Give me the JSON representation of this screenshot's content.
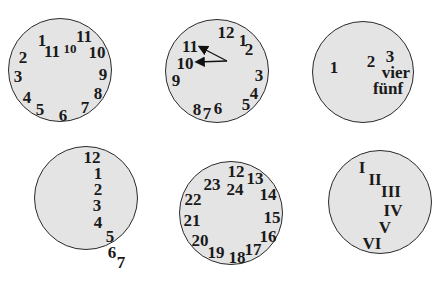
{
  "figure": {
    "colors": {
      "face": "#e4e4e4",
      "outline": "#2a2a2a",
      "text": "#1a1a1a",
      "background": "#ffffff"
    }
  },
  "clocks": [
    {
      "id": "clock-1",
      "circle": {
        "cx": 60,
        "cy": 70,
        "r": 52
      },
      "numbers": [
        {
          "label": "1",
          "x": 42,
          "y": 40,
          "size": 17
        },
        {
          "label": "11",
          "x": 52,
          "y": 51,
          "size": 17
        },
        {
          "label": "10",
          "x": 70,
          "y": 48,
          "size": 13
        },
        {
          "label": "11",
          "x": 84,
          "y": 36,
          "size": 17
        },
        {
          "label": "10",
          "x": 97,
          "y": 52,
          "size": 17
        },
        {
          "label": "2",
          "x": 23,
          "y": 57,
          "size": 17
        },
        {
          "label": "3",
          "x": 18,
          "y": 76,
          "size": 17
        },
        {
          "label": "9",
          "x": 103,
          "y": 74,
          "size": 17
        },
        {
          "label": "8",
          "x": 98,
          "y": 93,
          "size": 17
        },
        {
          "label": "4",
          "x": 27,
          "y": 97,
          "size": 17
        },
        {
          "label": "7",
          "x": 85,
          "y": 107,
          "size": 17
        },
        {
          "label": "5",
          "x": 40,
          "y": 109,
          "size": 17
        },
        {
          "label": "6",
          "x": 63,
          "y": 115,
          "size": 17
        }
      ]
    },
    {
      "id": "clock-2",
      "circle": {
        "cx": 217,
        "cy": 71,
        "r": 52
      },
      "numbers": [
        {
          "label": "12",
          "x": 226,
          "y": 32,
          "size": 17
        },
        {
          "label": "1",
          "x": 243,
          "y": 40,
          "size": 17
        },
        {
          "label": "2",
          "x": 249,
          "y": 49,
          "size": 17
        },
        {
          "label": "11",
          "x": 190,
          "y": 46,
          "size": 17
        },
        {
          "label": "10",
          "x": 185,
          "y": 63,
          "size": 17
        },
        {
          "label": "9",
          "x": 176,
          "y": 80,
          "size": 17
        },
        {
          "label": "3",
          "x": 259,
          "y": 75,
          "size": 17
        },
        {
          "label": "4",
          "x": 254,
          "y": 93,
          "size": 17
        },
        {
          "label": "5",
          "x": 246,
          "y": 104,
          "size": 17
        },
        {
          "label": "8",
          "x": 197,
          "y": 109,
          "size": 17
        },
        {
          "label": "7",
          "x": 207,
          "y": 113,
          "size": 17
        },
        {
          "label": "6",
          "x": 218,
          "y": 108,
          "size": 17
        }
      ],
      "hands": [
        {
          "x1": 227,
          "y1": 61,
          "x2": 200,
          "y2": 47
        },
        {
          "x1": 227,
          "y1": 61,
          "x2": 197,
          "y2": 62
        }
      ]
    },
    {
      "id": "clock-3",
      "circle": {
        "cx": 363,
        "cy": 72,
        "r": 51
      },
      "numbers": [
        {
          "label": "1",
          "x": 334,
          "y": 67,
          "size": 17
        },
        {
          "label": "2",
          "x": 371,
          "y": 61,
          "size": 17
        },
        {
          "label": "3",
          "x": 390,
          "y": 56,
          "size": 17
        },
        {
          "label": "vier",
          "x": 396,
          "y": 72,
          "size": 17
        },
        {
          "label": "fünf",
          "x": 388,
          "y": 88,
          "size": 17
        }
      ]
    },
    {
      "id": "clock-4",
      "circle": {
        "cx": 86,
        "cy": 198,
        "r": 52
      },
      "numbers": [
        {
          "label": "12",
          "x": 92,
          "y": 157,
          "size": 17
        },
        {
          "label": "1",
          "x": 98,
          "y": 173,
          "size": 17
        },
        {
          "label": "2",
          "x": 98,
          "y": 189,
          "size": 17
        },
        {
          "label": "3",
          "x": 97,
          "y": 205,
          "size": 17
        },
        {
          "label": "4",
          "x": 98,
          "y": 222,
          "size": 17
        },
        {
          "label": "5",
          "x": 110,
          "y": 236,
          "size": 17
        },
        {
          "label": "6",
          "x": 112,
          "y": 252,
          "size": 17
        },
        {
          "label": "7",
          "x": 121,
          "y": 262,
          "size": 17
        }
      ]
    },
    {
      "id": "clock-5",
      "circle": {
        "cx": 231,
        "cy": 213,
        "r": 52
      },
      "numbers": [
        {
          "label": "12",
          "x": 236,
          "y": 171,
          "size": 17
        },
        {
          "label": "13",
          "x": 255,
          "y": 178,
          "size": 17
        },
        {
          "label": "24",
          "x": 235,
          "y": 189,
          "size": 17
        },
        {
          "label": "23",
          "x": 212,
          "y": 184,
          "size": 17
        },
        {
          "label": "14",
          "x": 268,
          "y": 194,
          "size": 17
        },
        {
          "label": "22",
          "x": 193,
          "y": 199,
          "size": 17
        },
        {
          "label": "15",
          "x": 272,
          "y": 217,
          "size": 17
        },
        {
          "label": "21",
          "x": 192,
          "y": 220,
          "size": 17
        },
        {
          "label": "16",
          "x": 268,
          "y": 236,
          "size": 17
        },
        {
          "label": "20",
          "x": 200,
          "y": 240,
          "size": 17
        },
        {
          "label": "17",
          "x": 253,
          "y": 249,
          "size": 17
        },
        {
          "label": "19",
          "x": 216,
          "y": 252,
          "size": 17
        },
        {
          "label": "18",
          "x": 237,
          "y": 257,
          "size": 17
        }
      ]
    },
    {
      "id": "clock-6",
      "circle": {
        "cx": 380,
        "cy": 202,
        "r": 52
      },
      "numbers": [
        {
          "label": "I",
          "x": 362,
          "y": 167,
          "size": 17
        },
        {
          "label": "II",
          "x": 375,
          "y": 179,
          "size": 17
        },
        {
          "label": "III",
          "x": 391,
          "y": 191,
          "size": 17
        },
        {
          "label": "IV",
          "x": 393,
          "y": 210,
          "size": 17
        },
        {
          "label": "V",
          "x": 385,
          "y": 227,
          "size": 17
        },
        {
          "label": "VI",
          "x": 372,
          "y": 243,
          "size": 17
        }
      ]
    }
  ]
}
